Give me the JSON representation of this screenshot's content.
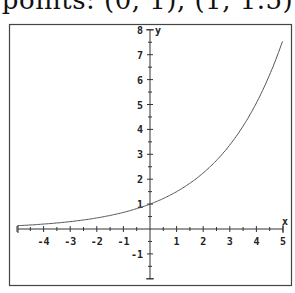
{
  "caption": "points: (0, 1), (1, 1.5)",
  "chart_data": {
    "type": "line",
    "title": "",
    "function": "y = 1.5^x",
    "xlabel": "x",
    "ylabel": "y",
    "xlim": [
      -5,
      5
    ],
    "ylim": [
      -2,
      8
    ],
    "x_ticks": [
      -4,
      -3,
      -2,
      -1,
      1,
      2,
      3,
      4,
      5
    ],
    "y_ticks": [
      -1,
      1,
      2,
      3,
      4,
      5,
      6,
      7,
      8
    ],
    "grid": false,
    "series": [
      {
        "name": "1.5^x",
        "x": [
          -5,
          -4,
          -3,
          -2,
          -1,
          0,
          1,
          2,
          3,
          4,
          5
        ],
        "values": [
          0.13,
          0.2,
          0.3,
          0.44,
          0.67,
          1,
          1.5,
          2.25,
          3.38,
          5.06,
          7.59
        ]
      }
    ],
    "highlighted_points": [
      [
        0,
        1
      ],
      [
        1,
        1.5
      ]
    ]
  },
  "colors": {
    "axis": "#333333",
    "curve": "#555555",
    "frame": "#444444"
  }
}
